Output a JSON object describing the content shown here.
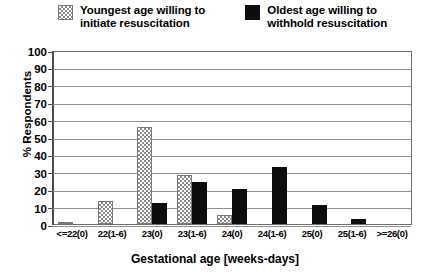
{
  "chart_data": {
    "type": "bar",
    "title": "",
    "xlabel": "Gestational age [weeks-days]",
    "ylabel": "% Respondents",
    "ylim": [
      0,
      100
    ],
    "yticks": [
      0,
      10,
      20,
      30,
      40,
      50,
      60,
      70,
      80,
      90,
      100
    ],
    "grid": true,
    "legend_position": "top",
    "categories": [
      "<=22(0)",
      "22(1-6)",
      "23(0)",
      "23(1-6)",
      "24(0)",
      "24(1-6)",
      "25(0)",
      "25(1-6)",
      ">=26(0)"
    ],
    "series": [
      {
        "name": "Youngest age willing to\ninitiate resuscitation",
        "pattern": "hatched",
        "color": "#8c8c8c",
        "values": [
          1,
          13,
          56,
          28,
          5,
          0,
          0,
          0,
          0
        ]
      },
      {
        "name": "Oldest age willing to\nwithhold resuscitation",
        "pattern": "solid",
        "color": "#0d0d0d",
        "values": [
          0,
          0,
          12,
          24,
          20,
          33,
          11,
          3,
          0
        ]
      }
    ]
  },
  "legend": {
    "entries": [
      {
        "label": "Youngest age willing to\ninitiate resuscitation",
        "swatch": "hatched-swatch"
      },
      {
        "label": "Oldest age willing to\nwithhold resuscitation",
        "swatch": "solid-swatch"
      }
    ]
  }
}
